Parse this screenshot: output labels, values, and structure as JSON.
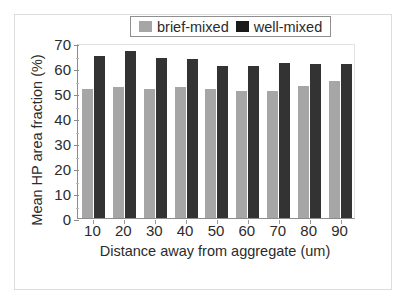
{
  "chart_data": {
    "type": "bar",
    "title": "",
    "xlabel": "Distance away from aggregate (um)",
    "ylabel": "Mean HP area fraction (%)",
    "categories": [
      "10",
      "20",
      "30",
      "40",
      "50",
      "60",
      "70",
      "80",
      "90"
    ],
    "series": [
      {
        "name": "brief-mixed",
        "color": "#a6a6a6",
        "values": [
          51.5,
          52.5,
          51.5,
          52.5,
          51.5,
          51.0,
          51.0,
          53.0,
          55.0
        ]
      },
      {
        "name": "well-mixed",
        "color": "#333333",
        "values": [
          65.0,
          67.0,
          64.0,
          63.5,
          61.0,
          61.0,
          62.0,
          61.5,
          61.5
        ]
      }
    ],
    "ylim": [
      0,
      70
    ],
    "ytick_labels": [
      "0",
      "10",
      "20",
      "30",
      "40",
      "50",
      "60",
      "70"
    ],
    "ytick_values": [
      0,
      10,
      20,
      30,
      40,
      50,
      60,
      70
    ],
    "grid": false,
    "legend_position": "top-center"
  },
  "legend": {
    "items": [
      {
        "label": "brief-mixed",
        "swatch": "gray-swatch-icon"
      },
      {
        "label": "well-mixed",
        "swatch": "black-swatch-icon"
      }
    ]
  }
}
